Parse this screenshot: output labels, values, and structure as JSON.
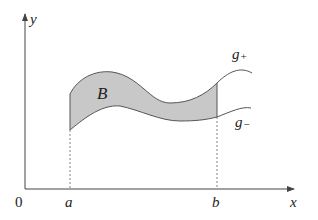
{
  "figure": {
    "type": "region-between-curves",
    "axis_labels": {
      "x": "x",
      "y": "y",
      "origin": "0"
    },
    "bounds": {
      "left": "a",
      "right": "b"
    },
    "region_label": "B",
    "curves": {
      "upper": {
        "label_main": "g",
        "label_sub": "+"
      },
      "lower": {
        "label_main": "g",
        "label_sub": "−"
      }
    },
    "colors": {
      "region_fill": "#c8c8c8",
      "curve_stroke": "#555555",
      "axis_stroke": "#444444"
    }
  }
}
